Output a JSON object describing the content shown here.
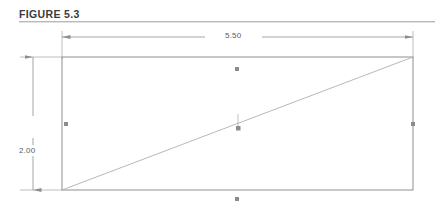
{
  "figure": {
    "title": "FIGURE 5.3",
    "title_color": "#3b3b3d",
    "rule_color": "#b9b9bb",
    "background_color": "#ffffff"
  },
  "drawing": {
    "type": "engineering-dimension-drawing",
    "line_color": "#9a9a9c",
    "dimension_line_color": "#8e8e90",
    "diagonal_color": "#b0b0b2",
    "marker_color": "#8c8c8e",
    "shape": {
      "name": "rectangle",
      "width_value": "5.50",
      "height_value": "2.00"
    },
    "dimensions": [
      {
        "name": "width",
        "label": "5.50",
        "orientation": "horizontal",
        "position": "top"
      },
      {
        "name": "height",
        "label": "2.00",
        "orientation": "vertical",
        "position": "left"
      }
    ],
    "diagonal": {
      "name": "diagonal-line",
      "from": "bottom-left",
      "to": "top-right",
      "label": ""
    },
    "markers": [
      {
        "name": "marker-top-center"
      },
      {
        "name": "marker-bottom-center"
      },
      {
        "name": "marker-right-center"
      },
      {
        "name": "marker-left-center"
      },
      {
        "name": "marker-diagonal-midpoint"
      }
    ]
  }
}
